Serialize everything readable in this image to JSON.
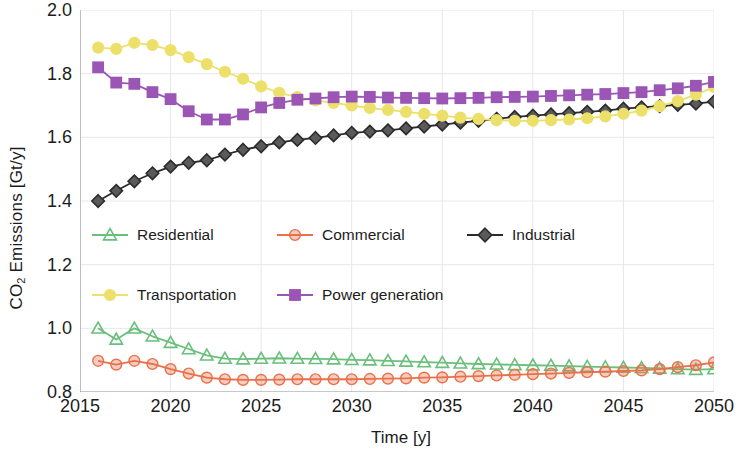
{
  "chart_data": {
    "type": "line",
    "title": "",
    "xlabel": "Time [y]",
    "ylabel": "CO2 Emissions [Gt/y]",
    "ylabel_display": "CO₂ Emissions [Gt/y]",
    "xlim": [
      2015,
      2050
    ],
    "ylim": [
      0.8,
      2.0
    ],
    "xticks": [
      "2015",
      "2020",
      "2025",
      "2030",
      "2035",
      "2040",
      "2045",
      "2050"
    ],
    "yticks": [
      "2.0",
      "1.8",
      "1.6",
      "1.4",
      "1.2",
      "1.0",
      "0.8"
    ],
    "grid": true,
    "legend_position": "center-left",
    "x": [
      2016,
      2017,
      2018,
      2019,
      2020,
      2021,
      2022,
      2023,
      2024,
      2025,
      2026,
      2027,
      2028,
      2029,
      2030,
      2031,
      2032,
      2033,
      2034,
      2035,
      2036,
      2037,
      2038,
      2039,
      2040,
      2041,
      2042,
      2043,
      2044,
      2045,
      2046,
      2047,
      2048,
      2049,
      2050
    ],
    "series": [
      {
        "name": "Residential",
        "color": "#6abf7b",
        "marker": "triangle",
        "values": [
          1.0,
          0.965,
          1.0,
          0.975,
          0.955,
          0.935,
          0.915,
          0.905,
          0.903,
          0.905,
          0.906,
          0.905,
          0.904,
          0.903,
          0.901,
          0.9,
          0.898,
          0.896,
          0.894,
          0.892,
          0.89,
          0.888,
          0.887,
          0.885,
          0.884,
          0.883,
          0.881,
          0.88,
          0.878,
          0.877,
          0.876,
          0.874,
          0.872,
          0.87,
          0.872
        ]
      },
      {
        "name": "Commercial",
        "color": "#e8714a",
        "marker": "circle",
        "values": [
          0.898,
          0.886,
          0.898,
          0.888,
          0.872,
          0.858,
          0.845,
          0.84,
          0.838,
          0.838,
          0.839,
          0.84,
          0.84,
          0.84,
          0.84,
          0.841,
          0.842,
          0.843,
          0.845,
          0.846,
          0.848,
          0.85,
          0.852,
          0.854,
          0.856,
          0.858,
          0.86,
          0.862,
          0.864,
          0.866,
          0.868,
          0.872,
          0.878,
          0.884,
          0.893
        ]
      },
      {
        "name": "Industrial",
        "color": "#2b2b2b",
        "marker": "diamond",
        "values": [
          1.4,
          1.432,
          1.462,
          1.487,
          1.508,
          1.52,
          1.528,
          1.546,
          1.561,
          1.572,
          1.584,
          1.592,
          1.598,
          1.606,
          1.614,
          1.618,
          1.622,
          1.628,
          1.634,
          1.64,
          1.646,
          1.652,
          1.658,
          1.664,
          1.668,
          1.672,
          1.676,
          1.68,
          1.684,
          1.69,
          1.694,
          1.698,
          1.702,
          1.706,
          1.712
        ]
      },
      {
        "name": "Transportation",
        "color": "#ece06a",
        "marker": "circle",
        "values": [
          1.882,
          1.878,
          1.897,
          1.89,
          1.874,
          1.852,
          1.83,
          1.806,
          1.784,
          1.76,
          1.74,
          1.726,
          1.716,
          1.708,
          1.7,
          1.692,
          1.686,
          1.68,
          1.674,
          1.668,
          1.662,
          1.658,
          1.654,
          1.652,
          1.652,
          1.654,
          1.656,
          1.66,
          1.666,
          1.674,
          1.684,
          1.698,
          1.714,
          1.734,
          1.758
        ]
      },
      {
        "name": "Power generation",
        "color": "#9b55b5",
        "marker": "square",
        "values": [
          1.82,
          1.772,
          1.768,
          1.742,
          1.72,
          1.682,
          1.656,
          1.656,
          1.672,
          1.694,
          1.708,
          1.718,
          1.722,
          1.726,
          1.728,
          1.727,
          1.725,
          1.724,
          1.723,
          1.722,
          1.723,
          1.724,
          1.726,
          1.727,
          1.728,
          1.73,
          1.732,
          1.734,
          1.736,
          1.739,
          1.742,
          1.748,
          1.754,
          1.762,
          1.774
        ]
      }
    ],
    "legend_rows": [
      [
        "Residential",
        "Commercial",
        "Industrial"
      ],
      [
        "Transportation",
        "Power generation"
      ]
    ]
  },
  "style": {
    "grid_color": "#e9e6ee",
    "axis_color": "#9a9a9a",
    "text_color": "#1c1c1c",
    "background": "#ffffff"
  }
}
